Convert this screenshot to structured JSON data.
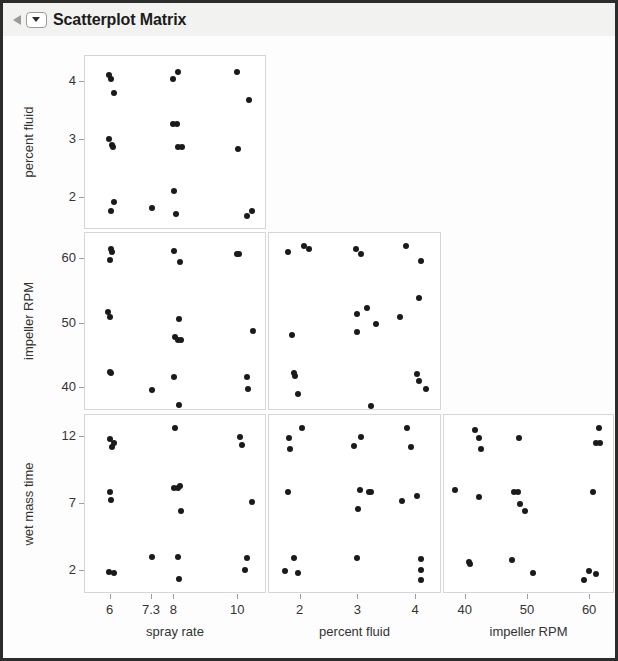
{
  "window": {
    "title": "Scatterplot Matrix",
    "disclosure_icon": "collapse-triangle-icon",
    "menu_icon": "panel-menu-dropdown-icon"
  },
  "chart_data": {
    "type": "scatter",
    "title": "Scatterplot Matrix",
    "grid": false,
    "legend": false,
    "variables": [
      "spray rate",
      "percent fluid",
      "impeller RPM",
      "wet mass time"
    ],
    "row_variables": [
      "percent fluid",
      "impeller RPM",
      "wet mass time"
    ],
    "column_variables": [
      "spray rate",
      "percent fluid",
      "impeller RPM"
    ],
    "axes": {
      "spray rate": {
        "ticks": [
          6,
          7.3,
          8,
          10
        ],
        "tick_labels": [
          "6",
          "7.3",
          "8",
          "10"
        ],
        "range": [
          5.2,
          10.9
        ]
      },
      "percent fluid": {
        "ticks": [
          2,
          3,
          4
        ],
        "tick_labels": [
          "2",
          "3",
          "4"
        ],
        "range": [
          1.45,
          4.45
        ]
      },
      "impeller RPM": {
        "ticks": [
          40,
          50,
          60
        ],
        "tick_labels": [
          "40",
          "50",
          "60"
        ],
        "range": [
          36.5,
          64.0
        ]
      },
      "wet mass time": {
        "ticks": [
          2,
          7,
          12
        ],
        "tick_labels": [
          "2",
          "7",
          "12"
        ],
        "range": [
          0.3,
          13.6
        ]
      }
    },
    "panels": [
      {
        "row": 0,
        "col": 0,
        "y": "percent fluid",
        "x": "spray rate",
        "points": [
          [
            5.95,
            4.12
          ],
          [
            6.02,
            4.05
          ],
          [
            6.12,
            3.82
          ],
          [
            5.95,
            3.02
          ],
          [
            6.03,
            2.92
          ],
          [
            6.07,
            2.88
          ],
          [
            6.1,
            1.93
          ],
          [
            6.02,
            1.78
          ],
          [
            7.3,
            1.83
          ],
          [
            7.97,
            4.05
          ],
          [
            8.12,
            4.18
          ],
          [
            7.95,
            3.28
          ],
          [
            8.08,
            3.28
          ],
          [
            8.12,
            2.88
          ],
          [
            8.25,
            2.88
          ],
          [
            7.98,
            2.12
          ],
          [
            8.05,
            1.72
          ],
          [
            9.95,
            4.18
          ],
          [
            10.35,
            3.7
          ],
          [
            9.98,
            2.85
          ],
          [
            10.28,
            1.7
          ],
          [
            10.42,
            1.78
          ]
        ]
      },
      {
        "row": 1,
        "col": 0,
        "y": "impeller RPM",
        "x": "spray rate",
        "points": [
          [
            6.0,
            61.5
          ],
          [
            6.05,
            61.0
          ],
          [
            5.98,
            59.8
          ],
          [
            5.92,
            51.8
          ],
          [
            5.98,
            51.0
          ],
          [
            5.97,
            42.5
          ],
          [
            6.02,
            42.3
          ],
          [
            7.3,
            39.8
          ],
          [
            8.0,
            61.2
          ],
          [
            8.18,
            59.5
          ],
          [
            8.15,
            50.7
          ],
          [
            8.03,
            48.0
          ],
          [
            8.1,
            47.5
          ],
          [
            8.2,
            47.5
          ],
          [
            7.98,
            41.8
          ],
          [
            8.15,
            37.5
          ],
          [
            9.95,
            60.8
          ],
          [
            10.02,
            60.8
          ],
          [
            10.45,
            48.8
          ],
          [
            10.28,
            41.8
          ],
          [
            10.3,
            39.9
          ]
        ]
      },
      {
        "row": 2,
        "col": 0,
        "y": "wet mass time",
        "x": "spray rate",
        "points": [
          [
            5.97,
            11.8
          ],
          [
            6.05,
            11.2
          ],
          [
            6.12,
            11.5
          ],
          [
            5.98,
            7.9
          ],
          [
            6.02,
            7.3
          ],
          [
            5.95,
            1.95
          ],
          [
            6.1,
            1.85
          ],
          [
            7.3,
            3.05
          ],
          [
            8.02,
            12.6
          ],
          [
            8.0,
            8.2
          ],
          [
            8.1,
            8.2
          ],
          [
            8.18,
            8.3
          ],
          [
            8.22,
            6.5
          ],
          [
            8.1,
            3.05
          ],
          [
            8.15,
            1.45
          ],
          [
            10.05,
            12.0
          ],
          [
            10.12,
            11.4
          ],
          [
            10.42,
            7.1
          ],
          [
            10.28,
            3.0
          ],
          [
            10.22,
            2.1
          ]
        ]
      },
      {
        "row": 1,
        "col": 1,
        "y": "impeller RPM",
        "x": "percent fluid",
        "points": [
          [
            1.78,
            61.0
          ],
          [
            2.05,
            62.0
          ],
          [
            2.15,
            61.5
          ],
          [
            2.95,
            61.5
          ],
          [
            3.05,
            60.8
          ],
          [
            3.82,
            62.0
          ],
          [
            4.08,
            59.6
          ],
          [
            1.85,
            48.2
          ],
          [
            2.98,
            51.5
          ],
          [
            3.15,
            52.4
          ],
          [
            3.3,
            50.0
          ],
          [
            2.98,
            48.7
          ],
          [
            3.72,
            51.0
          ],
          [
            4.05,
            54.0
          ],
          [
            1.88,
            42.3
          ],
          [
            1.9,
            41.9
          ],
          [
            1.95,
            39.2
          ],
          [
            3.22,
            37.3
          ],
          [
            4.02,
            42.2
          ],
          [
            4.05,
            41.2
          ],
          [
            4.18,
            39.9
          ]
        ]
      },
      {
        "row": 2,
        "col": 1,
        "y": "wet mass time",
        "x": "percent fluid",
        "points": [
          [
            1.8,
            11.9
          ],
          [
            2.02,
            12.6
          ],
          [
            1.82,
            11.1
          ],
          [
            2.92,
            11.3
          ],
          [
            3.05,
            12.0
          ],
          [
            3.85,
            12.6
          ],
          [
            3.92,
            11.2
          ],
          [
            1.78,
            7.9
          ],
          [
            3.02,
            8.0
          ],
          [
            3.18,
            7.9
          ],
          [
            3.22,
            7.9
          ],
          [
            3.75,
            7.2
          ],
          [
            4.02,
            7.6
          ],
          [
            3.0,
            6.6
          ],
          [
            1.88,
            3.0
          ],
          [
            1.72,
            2.0
          ],
          [
            1.95,
            1.85
          ],
          [
            2.98,
            3.0
          ],
          [
            4.08,
            2.9
          ],
          [
            4.08,
            2.1
          ],
          [
            4.08,
            1.35
          ]
        ]
      },
      {
        "row": 2,
        "col": 2,
        "y": "wet mass time",
        "x": "impeller RPM",
        "points": [
          [
            41.5,
            12.5
          ],
          [
            42.2,
            11.9
          ],
          [
            42.5,
            11.1
          ],
          [
            48.5,
            11.9
          ],
          [
            61.5,
            12.6
          ],
          [
            61.0,
            11.5
          ],
          [
            61.6,
            11.5
          ],
          [
            38.2,
            8.0
          ],
          [
            42.2,
            7.5
          ],
          [
            47.8,
            7.9
          ],
          [
            48.4,
            7.9
          ],
          [
            48.8,
            7.0
          ],
          [
            49.6,
            6.5
          ],
          [
            60.5,
            7.9
          ],
          [
            40.5,
            2.7
          ],
          [
            40.7,
            2.5
          ],
          [
            47.5,
            2.8
          ],
          [
            50.8,
            1.85
          ],
          [
            59.8,
            2.0
          ],
          [
            61.0,
            1.75
          ],
          [
            59.0,
            1.35
          ]
        ]
      }
    ]
  }
}
